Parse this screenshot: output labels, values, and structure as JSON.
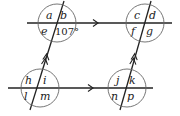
{
  "diagram": {
    "colors": {
      "line": "#222222",
      "circle": "#555555",
      "background": "#ffffff"
    },
    "intersections": [
      {
        "id": "top-left",
        "labels": {
          "tl": "a",
          "tr": "b",
          "bl": "e",
          "br": "107°"
        }
      },
      {
        "id": "top-right",
        "labels": {
          "tl": "c",
          "tr": "d",
          "bl": "f",
          "br": "g"
        }
      },
      {
        "id": "bottom-left",
        "labels": {
          "tl": "h",
          "tr": "i",
          "bl": "l",
          "br": "m"
        }
      },
      {
        "id": "bottom-right",
        "labels": {
          "tl": "j",
          "tr": "k",
          "bl": "n",
          "br": "p"
        }
      }
    ],
    "given_angle": "107°",
    "markers": {
      "horizontal_lines": "single-arrow",
      "transversals": "double-arrow"
    }
  }
}
